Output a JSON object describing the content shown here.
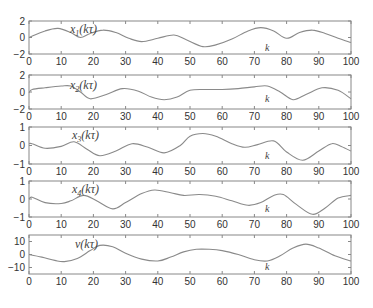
{
  "chart_data": [
    {
      "type": "line",
      "title": "",
      "label": "x1(kτ)",
      "label_parts": {
        "base": "x",
        "sub": "1",
        "arg": "(kτ)"
      },
      "xlabel": "k",
      "ylabel": "",
      "xlim": [
        0,
        100
      ],
      "ylim": [
        -2,
        2
      ],
      "xticks": [
        0,
        10,
        20,
        30,
        40,
        50,
        60,
        70,
        80,
        90,
        100
      ],
      "yticks": [
        -2,
        0,
        2
      ],
      "grid": false,
      "x": [
        0,
        5,
        9,
        13,
        16,
        19,
        23,
        27,
        31,
        35,
        40,
        45,
        49,
        54,
        58,
        63,
        68,
        72,
        76,
        80,
        84,
        88,
        92,
        96,
        100
      ],
      "values": [
        0,
        0.8,
        1.1,
        0.6,
        0,
        0.5,
        0.9,
        0.6,
        -0.1,
        -0.5,
        -0.1,
        0.3,
        -0.3,
        -1.1,
        -0.9,
        -0.2,
        0.8,
        1.2,
        0.8,
        -0.1,
        0.6,
        0.9,
        0.5,
        -0.1,
        -0.6
      ]
    },
    {
      "type": "line",
      "title": "",
      "label": "x2(kτ)",
      "label_parts": {
        "base": "x",
        "sub": "2",
        "arg": "(kτ)"
      },
      "xlabel": "k",
      "ylabel": "",
      "xlim": [
        0,
        100
      ],
      "ylim": [
        -2,
        2
      ],
      "xticks": [
        0,
        10,
        20,
        30,
        40,
        50,
        60,
        70,
        80,
        90,
        100
      ],
      "yticks": [
        -2,
        0,
        2
      ],
      "grid": false,
      "x": [
        0,
        1,
        5,
        10,
        13,
        16,
        19,
        24,
        29,
        34,
        38,
        42,
        46,
        50,
        55,
        60,
        65,
        70,
        74,
        78,
        82,
        86,
        91,
        96,
        100
      ],
      "values": [
        -0.1,
        0.3,
        0.5,
        0.7,
        0.7,
        0,
        -0.8,
        -0.3,
        0.4,
        0.1,
        -0.6,
        -0.9,
        -0.6,
        0.2,
        0.3,
        0.3,
        0.4,
        0.6,
        0.7,
        0,
        -0.9,
        -0.3,
        0.5,
        0.2,
        -0.8
      ]
    },
    {
      "type": "line",
      "title": "",
      "label": "x3(kτ)",
      "label_parts": {
        "base": "x",
        "sub": "3",
        "arg": "(kτ)"
      },
      "xlabel": "k",
      "ylabel": "",
      "xlim": [
        0,
        100
      ],
      "ylim": [
        -1,
        1
      ],
      "xticks": [
        0,
        10,
        20,
        30,
        40,
        50,
        60,
        70,
        80,
        90,
        100
      ],
      "yticks": [
        -1,
        0,
        1
      ],
      "grid": false,
      "x": [
        0,
        1,
        5,
        10,
        14,
        18,
        22,
        27,
        32,
        37,
        42,
        47,
        50,
        54,
        58,
        63,
        67,
        71,
        76,
        80,
        85,
        90,
        94,
        97,
        100
      ],
      "values": [
        0.1,
        0.1,
        -0.15,
        -0.05,
        0.2,
        -0.2,
        -0.55,
        -0.3,
        0.1,
        -0.1,
        -0.4,
        0,
        0.5,
        0.65,
        0.5,
        0.1,
        -0.1,
        0.05,
        0.25,
        -0.35,
        -0.8,
        -0.3,
        0.1,
        -0.05,
        -0.3
      ]
    },
    {
      "type": "line",
      "title": "",
      "label": "x4(kτ)",
      "label_parts": {
        "base": "x",
        "sub": "4",
        "arg": "(kτ)"
      },
      "xlabel": "k",
      "ylabel": "",
      "xlim": [
        0,
        100
      ],
      "ylim": [
        -1,
        1
      ],
      "xticks": [
        0,
        10,
        20,
        30,
        40,
        50,
        60,
        70,
        80,
        90,
        100
      ],
      "yticks": [
        -1,
        0,
        1
      ],
      "grid": false,
      "x": [
        0,
        1,
        5,
        10,
        13,
        17,
        21,
        26,
        30,
        35,
        39,
        44,
        48,
        53,
        58,
        63,
        68,
        72,
        76,
        79,
        83,
        88,
        92,
        96,
        100
      ],
      "values": [
        0,
        0.1,
        -0.2,
        -0.25,
        -0.1,
        0.2,
        -0.1,
        -0.55,
        -0.2,
        0.3,
        0.5,
        0.35,
        0.2,
        0.25,
        0.15,
        -0.1,
        -0.35,
        -0.2,
        0.2,
        0.25,
        -0.3,
        -0.85,
        -0.5,
        0.05,
        0.2
      ]
    },
    {
      "type": "line",
      "title": "",
      "label": "v(kτ)",
      "label_parts": {
        "base": "v",
        "sub": "",
        "arg": "(kτ)"
      },
      "xlabel": "k",
      "ylabel": "",
      "xlim": [
        0,
        100
      ],
      "ylim": [
        -15,
        15
      ],
      "xticks": [
        0,
        10,
        20,
        30,
        40,
        50,
        60,
        70,
        80,
        90,
        100
      ],
      "yticks": [
        -10,
        0,
        10
      ],
      "grid": false,
      "x": [
        0,
        4,
        8,
        11,
        15,
        19,
        22,
        26,
        30,
        35,
        40,
        44,
        48,
        52,
        56,
        60,
        65,
        70,
        74,
        78,
        82,
        86,
        90,
        95,
        100
      ],
      "values": [
        0,
        -2,
        -4.5,
        -5.5,
        -3,
        3,
        7,
        6,
        1,
        -3.5,
        -5,
        -2,
        2,
        4,
        4,
        3,
        0,
        -4,
        -5,
        -1,
        5,
        8,
        5,
        -1,
        -5
      ]
    }
  ],
  "figure": {
    "line_color": "#8a8a8a",
    "axis_color": "#888888",
    "text_color": "#333333"
  }
}
